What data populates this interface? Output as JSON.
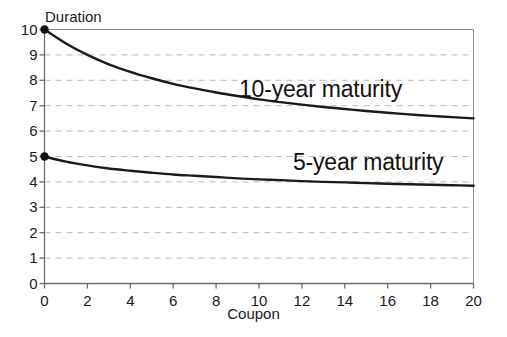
{
  "chart_data": {
    "type": "line",
    "title": "",
    "xlabel": "Coupon",
    "ylabel": "Duration",
    "xlim": [
      0,
      20
    ],
    "ylim": [
      0,
      10
    ],
    "xticks": [
      0,
      2,
      4,
      6,
      8,
      10,
      12,
      14,
      16,
      18,
      20
    ],
    "yticks": [
      0,
      1,
      2,
      3,
      4,
      5,
      6,
      7,
      8,
      9,
      10
    ],
    "xtick_labels": [
      "0",
      "2",
      "4",
      "6",
      "8",
      "10",
      "12",
      "14",
      "16",
      "18",
      "20"
    ],
    "ytick_labels": [
      "0",
      "1",
      "2",
      "3",
      "4",
      "5",
      "6",
      "7",
      "8",
      "9",
      "10"
    ],
    "grid": true,
    "grid_style": "dashed",
    "grid_color": "#b9b9b9",
    "legend_position": "inline-annotation",
    "line_color": "#1a1a1a",
    "marker_color": "#111111",
    "frame_color": "#8d8d8d",
    "background": "#ffffff",
    "series": [
      {
        "name": "10-year maturity",
        "label_text": "10-year maturity",
        "marker_at_zero": true,
        "x": [
          0,
          1,
          2,
          3,
          4,
          5,
          6,
          7,
          8,
          9,
          10,
          11,
          12,
          13,
          14,
          15,
          16,
          17,
          18,
          19,
          20
        ],
        "values": [
          10.0,
          9.45,
          9.0,
          8.63,
          8.33,
          8.08,
          7.86,
          7.68,
          7.52,
          7.38,
          7.25,
          7.14,
          7.04,
          6.95,
          6.87,
          6.79,
          6.72,
          6.66,
          6.6,
          6.55,
          6.5
        ]
      },
      {
        "name": "5-year maturity",
        "label_text": "5-year maturity",
        "marker_at_zero": true,
        "x": [
          0,
          1,
          2,
          3,
          4,
          5,
          6,
          7,
          8,
          9,
          10,
          11,
          12,
          13,
          14,
          15,
          16,
          17,
          18,
          19,
          20
        ],
        "values": [
          5.0,
          4.8,
          4.65,
          4.53,
          4.44,
          4.36,
          4.29,
          4.24,
          4.19,
          4.14,
          4.1,
          4.07,
          4.03,
          4.0,
          3.98,
          3.95,
          3.93,
          3.91,
          3.89,
          3.87,
          3.85
        ]
      }
    ]
  },
  "axes": {
    "y_title": "Duration",
    "x_title": "Coupon"
  }
}
